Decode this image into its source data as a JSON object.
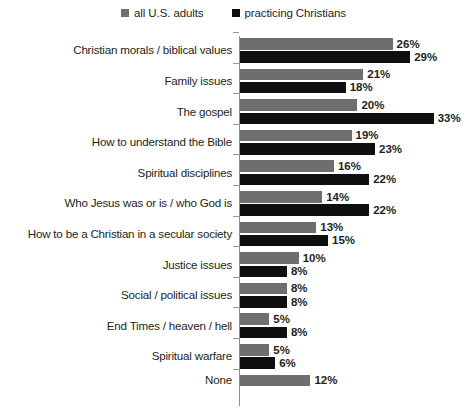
{
  "legend": {
    "entries": [
      {
        "label": "all U.S. adults",
        "color": "#6e6e6e",
        "marker": "square-marker"
      },
      {
        "label": "practicing Christians",
        "color": "#100f0f",
        "marker": "square-marker"
      }
    ]
  },
  "chart_data": {
    "type": "bar",
    "orientation": "horizontal",
    "title": "",
    "subtitle": "",
    "xlabel": "",
    "ylabel": "",
    "xlim": [
      0,
      35
    ],
    "grid": false,
    "legend_position": "top-center",
    "value_suffix": "%",
    "categories": [
      "Christian morals / biblical values",
      "Family issues",
      "The gospel",
      "How to understand the Bible",
      "Spiritual disciplines",
      "Who Jesus was or is / who God is",
      "How to be a Christian in a secular society",
      "Justice issues",
      "Social / political issues",
      "End Times / heaven / hell",
      "Spiritual warfare",
      "None"
    ],
    "series": [
      {
        "name": "all U.S. adults",
        "color": "#6e6e6e",
        "values": [
          26,
          21,
          20,
          19,
          16,
          14,
          13,
          10,
          8,
          5,
          5,
          12
        ],
        "labels": [
          "26%",
          "21%",
          "20%",
          "19%",
          "16%",
          "14%",
          "13%",
          "10%",
          "8%",
          "5%",
          "5%",
          "12%"
        ]
      },
      {
        "name": "practicing Christians",
        "color": "#100f0f",
        "values": [
          29,
          18,
          33,
          23,
          22,
          22,
          15,
          8,
          8,
          8,
          6,
          null
        ],
        "labels": [
          "29%",
          "18%",
          "33%",
          "23%",
          "22%",
          "22%",
          "15%",
          "8%",
          "8%",
          "8%",
          "6%",
          null
        ]
      }
    ]
  }
}
